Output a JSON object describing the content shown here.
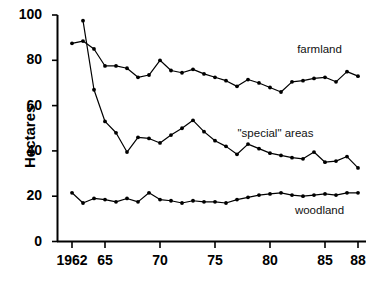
{
  "chart_data": {
    "type": "line",
    "title": "",
    "xlabel": "",
    "ylabel": "Hectares",
    "xlim": [
      1962,
      1988
    ],
    "ylim": [
      0,
      100
    ],
    "yticks": [
      0,
      20,
      40,
      60,
      80,
      100
    ],
    "ytick_labels": [
      "0",
      "20",
      "40",
      "60",
      "80",
      "100"
    ],
    "xticks": [
      1962,
      1965,
      1970,
      1975,
      1980,
      1985,
      1988
    ],
    "xtick_labels": [
      "1962",
      "65",
      "70",
      "75",
      "80",
      "85",
      "88"
    ],
    "grid": false,
    "legend_position": "inline-right-annotations",
    "x": [
      1962,
      1963,
      1964,
      1965,
      1966,
      1967,
      1968,
      1969,
      1970,
      1971,
      1972,
      1973,
      1974,
      1975,
      1976,
      1977,
      1978,
      1979,
      1980,
      1981,
      1982,
      1983,
      1984,
      1985,
      1986,
      1987
    ],
    "series": [
      {
        "name": "farmland",
        "label": "farmland",
        "color": "#000000",
        "values": [
          87.5,
          88.5,
          85.0,
          77.5,
          77.5,
          76.5,
          72.5,
          73.5,
          80.0,
          75.5,
          74.5,
          76.0,
          74.0,
          72.5,
          71.0,
          68.5,
          71.5,
          70.0,
          68.0,
          66.0,
          70.5,
          71.0,
          72.0,
          72.5,
          70.5,
          75.0
        ]
      },
      {
        "name": "special-areas",
        "label": "\"special\" areas",
        "color": "#000000",
        "values": [
          null,
          97.5,
          67.0,
          53.0,
          48.0,
          39.5,
          46.0,
          45.5,
          43.5,
          47.0,
          50.0,
          53.5,
          48.5,
          44.5,
          42.0,
          38.5,
          43.0,
          41.0,
          39.0,
          38.0,
          37.0,
          36.5,
          39.5,
          35.0,
          35.5,
          37.5
        ]
      },
      {
        "name": "woodland",
        "label": "woodland",
        "color": "#000000",
        "values": [
          21.5,
          17.0,
          19.0,
          18.5,
          17.5,
          19.0,
          17.5,
          21.5,
          18.5,
          18.0,
          17.0,
          18.0,
          17.5,
          17.5,
          17.0,
          18.5,
          19.5,
          20.5,
          21.0,
          21.5,
          20.5,
          20.0,
          20.5,
          21.0,
          20.5,
          21.5
        ]
      }
    ],
    "series_extra_tail": {
      "farmland": [
        73.0
      ],
      "special-areas": [
        32.5
      ],
      "woodland": [
        21.5
      ]
    },
    "annotations": [
      {
        "text": "farmland",
        "x": 1984.5,
        "y": 84
      },
      {
        "text": "\"special\" areas",
        "x": 1980.5,
        "y": 47
      },
      {
        "text": "woodland",
        "x": 1984.5,
        "y": 13
      }
    ]
  },
  "caption": {
    "text": ""
  }
}
